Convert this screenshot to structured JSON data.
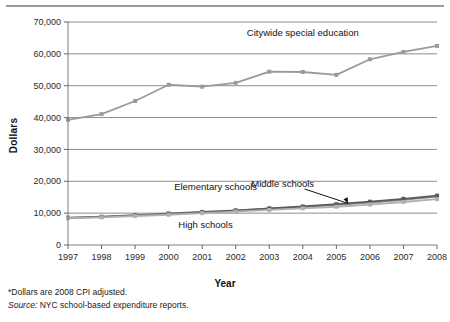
{
  "figure": {
    "ylabel": "Dollars",
    "xlabel": "Year",
    "notes": {
      "footnote": "*Dollars are 2008 CPI adjusted.",
      "source_prefix": "Source:",
      "source_text": " NYC school-based expenditure reports."
    }
  },
  "chart_data": {
    "type": "line",
    "title": "",
    "xlabel": "Year",
    "ylabel": "Dollars",
    "categories": [
      "1997",
      "1998",
      "1999",
      "2000",
      "2001",
      "2002",
      "2003",
      "2004",
      "2005",
      "2006",
      "2007",
      "2008"
    ],
    "x": [
      1997,
      1998,
      1999,
      2000,
      2001,
      2002,
      2003,
      2004,
      2005,
      2006,
      2007,
      2008
    ],
    "ylim": [
      0,
      70000
    ],
    "ytick_labels": [
      "0",
      "10,000",
      "20,000",
      "30,000",
      "40,000",
      "50,000",
      "60,000",
      "70,000"
    ],
    "ytick_values": [
      0,
      10000,
      20000,
      30000,
      40000,
      50000,
      60000,
      70000
    ],
    "grid": "horizontal",
    "legend": "inline-annotations",
    "series": [
      {
        "name": "Citywide special education",
        "color": "#9a9a9a",
        "label_position": "above-right",
        "values": [
          39300,
          41100,
          45200,
          50300,
          49700,
          50900,
          54400,
          54300,
          53400,
          58300,
          60600,
          62500
        ]
      },
      {
        "name": "Elementary schools",
        "color": "#8c8c8c",
        "label_position": "above",
        "values": [
          8600,
          8900,
          9400,
          9900,
          10400,
          10900,
          11400,
          11900,
          12600,
          13300,
          14200,
          15200
        ]
      },
      {
        "name": "Middle schools",
        "color": "#5a5a5a",
        "label_position": "above-right",
        "values": [
          8500,
          8800,
          9300,
          9800,
          10300,
          10800,
          11500,
          12100,
          12800,
          13600,
          14500,
          15500
        ]
      },
      {
        "name": "High schools",
        "color": "#b0b0b0",
        "label_position": "below",
        "values": [
          8400,
          8700,
          9100,
          9500,
          10000,
          10500,
          11000,
          11500,
          12000,
          12700,
          13500,
          14400
        ]
      }
    ],
    "annotations": [
      {
        "text": "Citywide special education",
        "x": 2004.0,
        "y": 65500
      },
      {
        "text": "Elementary schools",
        "x": 2001.4,
        "y": 17300
      },
      {
        "text": "Middle schools",
        "x": 2003.4,
        "y": 18300
      },
      {
        "text": "High schools",
        "x": 2001.1,
        "y": 5200
      }
    ]
  }
}
